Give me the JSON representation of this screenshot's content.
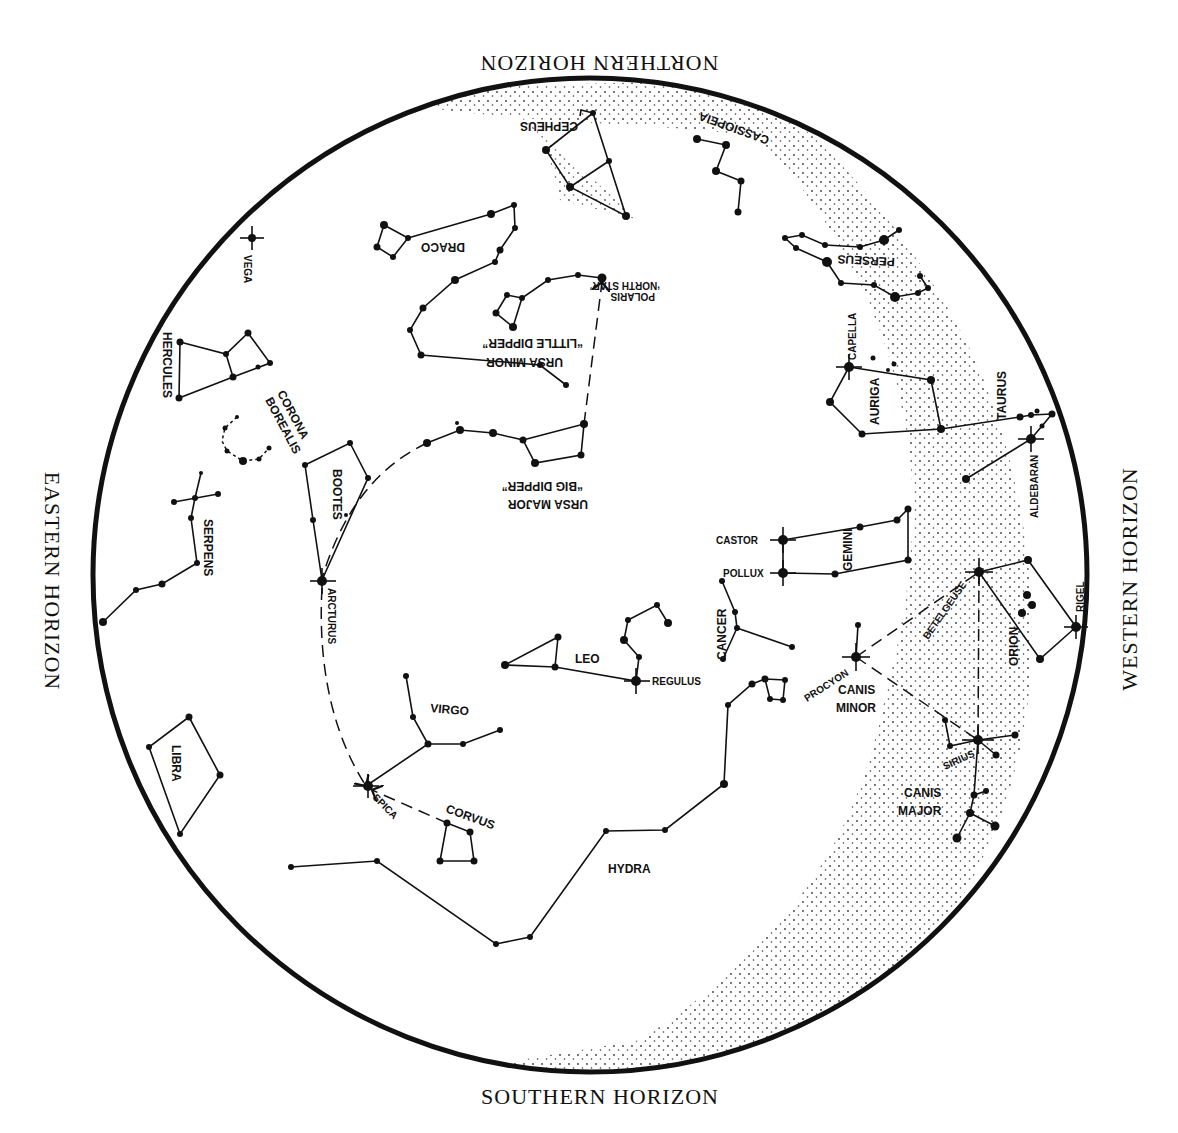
{
  "horizons": {
    "north": "NORTHERN HORIZON",
    "south": "SOUTHERN HORIZON",
    "east": "EASTERN HORIZON",
    "west": "WESTERN HORIZON"
  },
  "constellations": {
    "cepheus": "CEPHEUS",
    "cassiopeia": "CASSIOPEIA",
    "draco": "DRACO",
    "perseus": "PERSEUS",
    "ursa_minor": "URSA MINOR",
    "little_dipper": "“LITTLE DIPPER”",
    "ursa_major": "URSA MAJOR",
    "big_dipper": "“BIG DIPPER”",
    "hercules": "HERCULES",
    "corona": "CORONA",
    "borealis": "BOREALIS",
    "bootes": "BOOTES",
    "serpens": "SERPENS",
    "auriga": "AURIGA",
    "taurus": "TAURUS",
    "gemini": "GEMINI",
    "cancer": "CANCER",
    "leo": "LEO",
    "virgo": "VIRGO",
    "corvus": "CORVUS",
    "libra": "LIBRA",
    "hydra": "HYDRA",
    "orion": "ORION",
    "canis_minor_1": "CANIS",
    "canis_minor_2": "MINOR",
    "canis_major_1": "CANIS",
    "canis_major_2": "MAJOR"
  },
  "stars": {
    "vega": "VEGA",
    "polaris": "POLARIS",
    "north_star": "‘NORTH STAR’",
    "capella": "CAPELLA",
    "aldebaran": "ALDEBARAN",
    "castor": "CASTOR",
    "pollux": "POLLUX",
    "arcturus": "ARCTURUS",
    "regulus": "REGULUS",
    "spica": "SPICA",
    "procyon": "PROCYON",
    "betelgeuse": "BETELGEUSE",
    "rigel": "RIGEL",
    "sirius": "SIRIUS"
  }
}
